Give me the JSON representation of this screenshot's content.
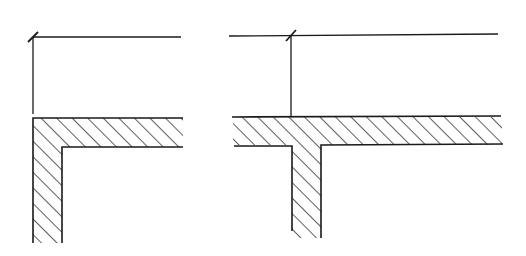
{
  "figure": {
    "colors": {
      "line": "#1a1a1a",
      "background": "#ffffff"
    },
    "diagrams": [
      {
        "name": "corner-junction",
        "type": "L-shaped wall corner",
        "dimension_line": {
          "x1": 33,
          "y1": 37,
          "x2": 181,
          "y2": 37,
          "tick_at": [
            33,
            37
          ]
        },
        "extension_line": {
          "x": 33,
          "y1": 37,
          "y2": 114
        },
        "horizontal_wall": {
          "x1": 33,
          "x2": 183,
          "y_top": 118,
          "y_bottom": 147
        },
        "vertical_wall": {
          "x_left": 33,
          "x_right": 62,
          "y_top": 118,
          "y_bottom": 243
        }
      },
      {
        "name": "tee-junction",
        "type": "T-shaped wall junction",
        "dimension_line": {
          "x1": 229,
          "y1": 36,
          "x2": 498,
          "y2": 34,
          "tick_at": [
            291,
            36
          ]
        },
        "extension_line": {
          "x": 291,
          "y1": 36,
          "y2": 117
        },
        "horizontal_wall": {
          "x1": 233,
          "x2": 502,
          "y_top": 117,
          "y_bottom": 145
        },
        "vertical_wall": {
          "x_left": 292,
          "x_right": 321,
          "y_top": 145,
          "y_bottom": 238
        }
      }
    ]
  }
}
